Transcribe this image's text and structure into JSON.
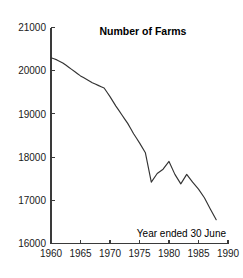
{
  "chart_data": {
    "type": "line",
    "title": "Number of Farms",
    "annotation": "Year ended 30 June",
    "xlabel": "",
    "ylabel": "",
    "xlim": [
      1960,
      1990
    ],
    "ylim": [
      16000,
      21000
    ],
    "grid": false,
    "legend": false,
    "x_ticks": [
      1960,
      1965,
      1970,
      1975,
      1980,
      1985,
      1990
    ],
    "y_ticks": [
      16000,
      17000,
      18000,
      19000,
      20000,
      21000
    ],
    "x_tick_labels": [
      "1960",
      "1965",
      "1970",
      "1975",
      "1980",
      "1985",
      "1990"
    ],
    "y_tick_labels": [
      "16000",
      "17000",
      "18000",
      "19000",
      "20000",
      "21000"
    ],
    "line_color": "#333333",
    "series": [
      {
        "name": "Number of Farms",
        "x": [
          1960,
          1961,
          1962,
          1963,
          1964,
          1965,
          1966,
          1967,
          1968,
          1969,
          1970,
          1971,
          1972,
          1973,
          1974,
          1975,
          1976,
          1977,
          1978,
          1979,
          1980,
          1981,
          1982,
          1983,
          1984,
          1985,
          1986,
          1987,
          1988
        ],
        "values": [
          20300,
          20250,
          20180,
          20080,
          19980,
          19880,
          19800,
          19720,
          19660,
          19600,
          19400,
          19180,
          18980,
          18780,
          18540,
          18330,
          18100,
          17420,
          17620,
          17720,
          17900,
          17600,
          17380,
          17600,
          17420,
          17260,
          17060,
          16800,
          16550
        ]
      }
    ]
  },
  "axes": {
    "title_anchor": "top-center",
    "annotation_anchor": "bottom-right"
  }
}
